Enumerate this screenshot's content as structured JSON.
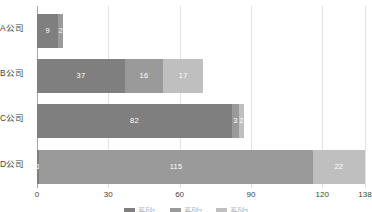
{
  "chart_data": {
    "type": "bar",
    "orientation": "horizontal",
    "stacked": true,
    "title": "",
    "xlabel": "",
    "ylabel": "",
    "categories": [
      "A公司",
      "B公司",
      "C公司",
      "D公司"
    ],
    "series": [
      {
        "name": "系列1",
        "color": "#7f7f7f",
        "values": [
          9,
          37,
          82,
          1
        ]
      },
      {
        "name": "系列2",
        "color": "#9a9a9a",
        "values": [
          2,
          16,
          3,
          115
        ]
      },
      {
        "name": "系列3",
        "color": "#bfbfbf",
        "values": [
          0,
          17,
          2,
          22
        ]
      }
    ],
    "totals": [
      11,
      70,
      87,
      138
    ],
    "xlim": [
      0,
      138
    ],
    "xticks": [
      0,
      30,
      60,
      90,
      120,
      138
    ],
    "xtick_labels": [
      "0",
      "30",
      "60",
      "90",
      "120",
      "138"
    ],
    "grid": true,
    "legend_position": "bottom",
    "bar_labels": [
      [
        "9",
        "2",
        ""
      ],
      [
        "37",
        "16",
        "17"
      ],
      [
        "82",
        "3",
        "2"
      ],
      [
        "1",
        "115",
        "22"
      ]
    ]
  },
  "colors": {
    "series_1": "#7f7f7f",
    "series_2": "#9a9a9a",
    "series_3": "#bfbfbf",
    "gridline": "#e2e2e2",
    "axis": "#a6a6a6",
    "text": "#3f3f3f",
    "label_text": "#ffffff",
    "background": "#ffffff"
  },
  "legend": {
    "items": [
      {
        "label": "系列1",
        "color": "#7f7f7f"
      },
      {
        "label": "系列2",
        "color": "#9a9a9a"
      },
      {
        "label": "系列3",
        "color": "#bfbfbf"
      }
    ]
  }
}
